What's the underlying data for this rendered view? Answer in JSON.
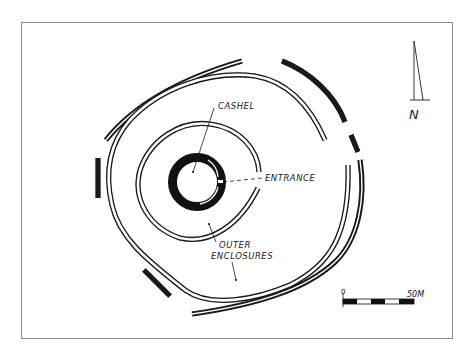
{
  "diagram": {
    "type": "archaeological site plan",
    "labels": {
      "cashel": "CASHEL",
      "entrance": "ENTRANCE",
      "outer_enclosures_line1": "OUTER",
      "outer_enclosures_line2": "ENCLOSURES"
    },
    "north_arrow": {
      "label": "N",
      "icon": "north-arrow-icon"
    },
    "scale_bar": {
      "start_label": "0",
      "end_label": "50M",
      "segments": 5
    },
    "colors": {
      "ink": "#1a1a1a",
      "paper": "#ffffff",
      "frame": "#8a8a8a"
    },
    "features": [
      {
        "name": "cashel",
        "description": "central stone ring fort"
      },
      {
        "name": "inner-enclosure",
        "description": "hachured bank encircling cashel, open at entrance"
      },
      {
        "name": "middle-enclosure",
        "description": "hachured bank ring"
      },
      {
        "name": "outer-enclosure",
        "description": "segmented hachured bank ring"
      }
    ]
  }
}
